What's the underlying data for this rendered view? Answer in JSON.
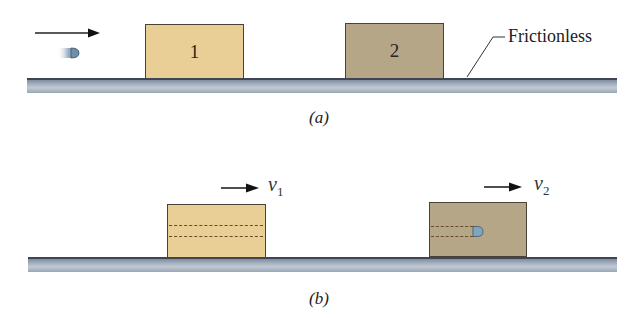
{
  "figure": {
    "panel_a": {
      "caption": "(a)",
      "block1_label": "1",
      "block2_label": "2",
      "surface_label": "Frictionless"
    },
    "panel_b": {
      "caption": "(b)",
      "velocity1": {
        "symbol": "v",
        "subscript": "1"
      },
      "velocity2": {
        "symbol": "v",
        "subscript": "2"
      }
    },
    "colors": {
      "block1": "#e9cf96",
      "block2": "#b5a688",
      "surface": "#a9b4c2",
      "bullet": "#6f8fa8"
    }
  }
}
